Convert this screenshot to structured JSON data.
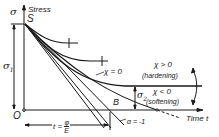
{
  "diagram": {
    "axes": {
      "y_symbol": "σ",
      "y_label": "Stress",
      "x_label": "Time t",
      "origin": "O",
      "start_point": "S"
    },
    "labels": {
      "sigma1": "σ",
      "sigma1_sub": "1",
      "sigma2": "σ",
      "sigma2_sub": "2",
      "chi_zero": "χ = 0",
      "chi_pos": "χ > 0",
      "hardening": "(hardening)",
      "chi_neg": "χ < 0",
      "softening": "(softening)",
      "point_b": "B",
      "alpha": "α = -1",
      "t_eq": "t =",
      "frac_num": "φ",
      "frac_den": "E"
    },
    "colors": {
      "ink": "#1a1a1a",
      "background": "#ffffff"
    }
  }
}
